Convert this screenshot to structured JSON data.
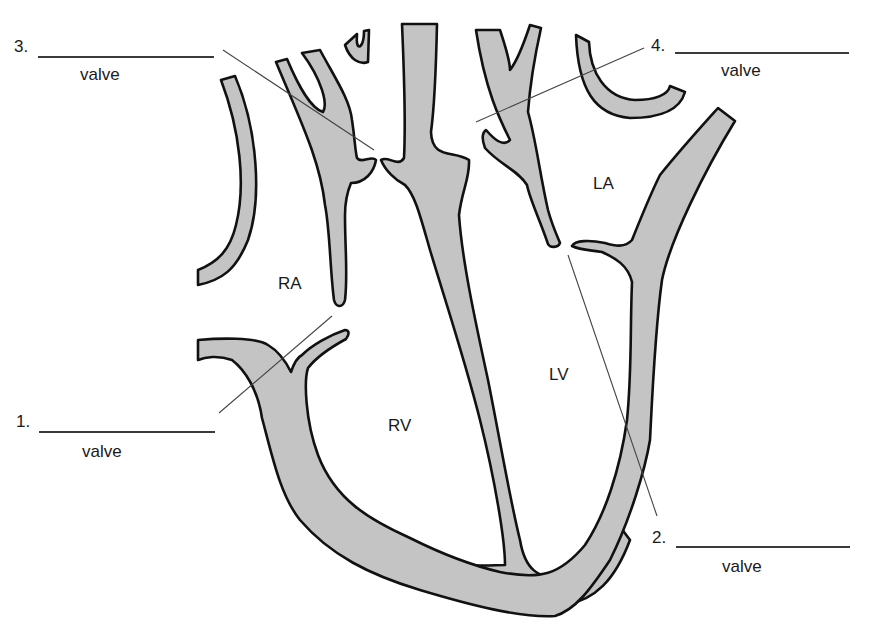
{
  "diagram": {
    "chambers": [
      {
        "id": "RA",
        "label": "RA"
      },
      {
        "id": "LA",
        "label": "LA"
      },
      {
        "id": "RV",
        "label": "RV"
      },
      {
        "id": "LV",
        "label": "LV"
      }
    ],
    "valve_labels": [
      {
        "number": "1.",
        "caption": "valve",
        "blank": ""
      },
      {
        "number": "2.",
        "caption": "valve",
        "blank": ""
      },
      {
        "number": "3.",
        "caption": "valve",
        "blank": ""
      },
      {
        "number": "4.",
        "caption": "valve",
        "blank": ""
      }
    ],
    "colors": {
      "wall_fill": "#c4c4c4",
      "outline": "#111111",
      "leader_line": "#444444",
      "background": "#ffffff"
    }
  }
}
